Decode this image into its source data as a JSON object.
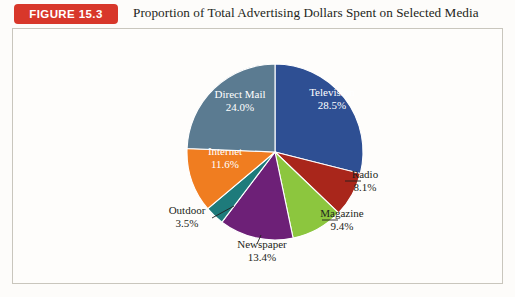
{
  "header": {
    "badge_label": "FIGURE 15.3",
    "title": "Proportion of Total Advertising Dollars Spent on Selected Media",
    "badge_color": "#d8372a",
    "badge_text_color": "#ffffff"
  },
  "chart_data": {
    "type": "pie",
    "title": "Proportion of Total Advertising Dollars Spent on Selected Media",
    "categories": [
      "Television",
      "Radio",
      "Magazine",
      "Newspaper",
      "Outdoor",
      "Internet",
      "Direct Mail"
    ],
    "values": [
      28.5,
      8.1,
      9.4,
      13.4,
      3.5,
      11.6,
      24.0
    ],
    "unit": "%",
    "start_angle_deg": 0,
    "direction": "clockwise",
    "legend": "none",
    "labels_mode": "callout-and-inside",
    "slices": [
      {
        "name": "Television",
        "label": "Television",
        "value": 28.5,
        "value_label": "28.5%",
        "color": "#2e4f93",
        "label_placement": "inside",
        "label_x": 320,
        "label_y": 68
      },
      {
        "name": "Radio",
        "label": "Radio",
        "value": 8.1,
        "value_label": "8.1%",
        "color": "#a9261b",
        "label_placement": "outside",
        "label_x": 353,
        "label_y": 150,
        "leader": [
          333,
          153,
          349,
          153
        ]
      },
      {
        "name": "Magazine",
        "label": "Magazine",
        "value": 9.4,
        "value_label": "9.4%",
        "color": "#8cc63e",
        "label_placement": "outside",
        "label_x": 330,
        "label_y": 189,
        "leader": [
          310,
          192,
          326,
          192
        ]
      },
      {
        "name": "Newspaper",
        "label": "Newspaper",
        "value": 13.4,
        "value_label": "13.4%",
        "color": "#6d2077",
        "label_placement": "outside",
        "label_x": 250,
        "label_y": 220,
        "leader": [
          249,
          207,
          245,
          216
        ]
      },
      {
        "name": "Outdoor",
        "label": "Outdoor",
        "value": 3.5,
        "value_label": "3.5%",
        "color": "#1e7b7b",
        "label_placement": "outside",
        "label_x": 175,
        "label_y": 186,
        "leader": [
          222,
          178,
          200,
          190
        ]
      },
      {
        "name": "Internet",
        "label": "Internet",
        "value": 11.6,
        "value_label": "11.6%",
        "color": "#f07d20",
        "label_placement": "inside",
        "label_x": 213,
        "label_y": 127
      },
      {
        "name": "Direct Mail",
        "label": "Direct Mail",
        "value": 24.0,
        "value_label": "24.0%",
        "color": "#5b7b91",
        "label_placement": "inside",
        "label_x": 228,
        "label_y": 70
      }
    ],
    "geometry": {
      "center_x": 263,
      "center_y": 124,
      "radius": 88
    }
  }
}
